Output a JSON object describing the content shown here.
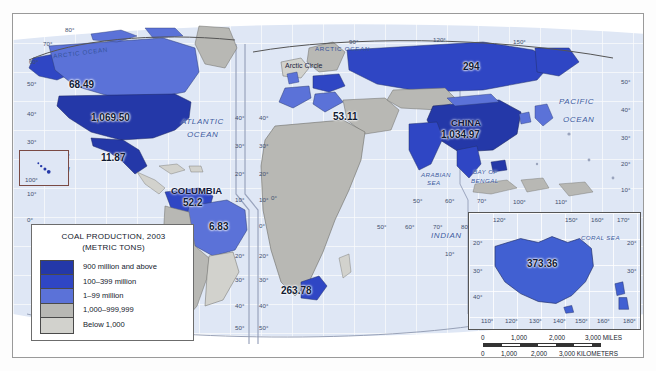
{
  "map": {
    "title_legend": {
      "line1": "COAL PRODUCTION, 2003",
      "line2": "(METRIC TONS)",
      "classes": [
        {
          "label": "900 million and above",
          "color": "#2438a8"
        },
        {
          "label": "100–399 million",
          "color": "#2f46c4"
        },
        {
          "label": "1–99 million",
          "color": "#5b72d8"
        },
        {
          "label": "1,000–999,999",
          "color": "#b8b8b4"
        },
        {
          "label": "Below 1,000",
          "color": "#d2d2cd"
        }
      ]
    },
    "projection_note": "MODIFIED GOODE'S HOMOLOSINE EQUAL-AREA PROJECTION",
    "country_values": [
      {
        "name": "canada",
        "value": "68.49",
        "country_label": ""
      },
      {
        "name": "united-states",
        "value": "1,069.50",
        "country_label": ""
      },
      {
        "name": "mexico",
        "value": "11.87",
        "country_label": ""
      },
      {
        "name": "colombia",
        "value": "52.2",
        "country_label": "COLUMBIA"
      },
      {
        "name": "brazil",
        "value": "6.83",
        "country_label": ""
      },
      {
        "name": "europe",
        "value": "53.11",
        "country_label": ""
      },
      {
        "name": "russia",
        "value": "294",
        "country_label": ""
      },
      {
        "name": "china",
        "value": "1,034.97",
        "country_label": "CHINA"
      },
      {
        "name": "south-africa",
        "value": "263.78",
        "country_label": ""
      },
      {
        "name": "australia",
        "value": "373.36",
        "country_label": ""
      }
    ],
    "ocean_labels": [
      {
        "name": "arctic-ocean-west",
        "text": "ARCTIC OCEAN"
      },
      {
        "name": "arctic-ocean-east",
        "text": "ARCTIC OCEAN"
      },
      {
        "name": "arctic-circle",
        "text": "Arctic Circle"
      },
      {
        "name": "atlantic-ocean",
        "text_line1": "ATLANTIC",
        "text_line2": "OCEAN"
      },
      {
        "name": "pacific-ocean-west",
        "text_line1": "PACIFIC",
        "text_line2": "OCEAN"
      },
      {
        "name": "pacific-ocean-east",
        "text_line1": "PACIFIC",
        "text_line2": "OCEAN"
      },
      {
        "name": "indian-ocean",
        "text_line1": "INDIAN",
        "text_line2": "OCEAN"
      },
      {
        "name": "arabian-sea",
        "text_line1": "ARABIAN",
        "text_line2": "SEA"
      },
      {
        "name": "bay-of-bengal",
        "text_line1": "BAY OF",
        "text_line2": "BENGAL"
      },
      {
        "name": "coral-sea",
        "text": "CORAL SEA"
      }
    ],
    "ocean_text": {
      "arctic_ocean": "ARCTIC OCEAN",
      "arctic_circle": "Arctic Circle",
      "atlantic_1": "ATLANTIC",
      "atlantic_2": "OCEAN",
      "pacific_1": "PACIFIC",
      "pacific_2": "OCEAN",
      "indian_1": "INDIAN",
      "indian_2": "OCEAN",
      "arabian_1": "ARABIAN",
      "arabian_2": "SEA",
      "bengal_1": "BAY OF",
      "bengal_2": "BENGAL",
      "coral": "CORAL SEA"
    },
    "latitude_ticks_left": [
      "80°",
      "70°",
      "60°",
      "50°",
      "40°",
      "30°",
      "20°",
      "10°",
      "0°"
    ],
    "latitude_ticks_right": [
      "50°",
      "40°",
      "30°",
      "20°",
      "10°"
    ],
    "hawaii_inset_label": "100°",
    "atlantic_ticks": [
      "40°",
      "30°",
      "20°",
      "10°"
    ],
    "africa_ticks": [
      "20°",
      "30°",
      "40°",
      "50°"
    ],
    "indian_lon_ticks": [
      "50°",
      "60°",
      "70°",
      "80°",
      "90°"
    ],
    "east_lon_ticks": [
      "120°",
      "130°",
      "140°",
      "150°",
      "160°",
      "170°",
      "180°"
    ],
    "misc_ticks": [
      "0°",
      "50°",
      "60°",
      "70°",
      "10°",
      "20°",
      "30°",
      "40°"
    ]
  },
  "australia_inset": {
    "value": "373.36",
    "lon_top": [
      "120°",
      "150°",
      "160°",
      "170°"
    ],
    "lon_bottom": [
      "110°",
      "120°",
      "130°",
      "140°",
      "150°",
      "160°",
      "180°"
    ],
    "lat_left": [
      "20°",
      "30°",
      "40°"
    ],
    "lat_right": [
      "20°",
      "30°"
    ],
    "coral_sea": "CORAL SEA"
  },
  "scale": {
    "miles_ticks": [
      "0",
      "1,000",
      "2,000",
      "3,000 MILES"
    ],
    "km_ticks": [
      "0",
      "1,000",
      "2,000",
      "3,000 KILOMETERS"
    ]
  },
  "colors": {
    "class_900_plus": "#2438a8",
    "class_100_399": "#2f46c4",
    "class_1_99": "#5b72d8",
    "class_1k_999k": "#b8b8b4",
    "class_below_1k": "#d2d2cd",
    "ocean": "#dfe7f5",
    "frame": "#9a9a9a"
  }
}
